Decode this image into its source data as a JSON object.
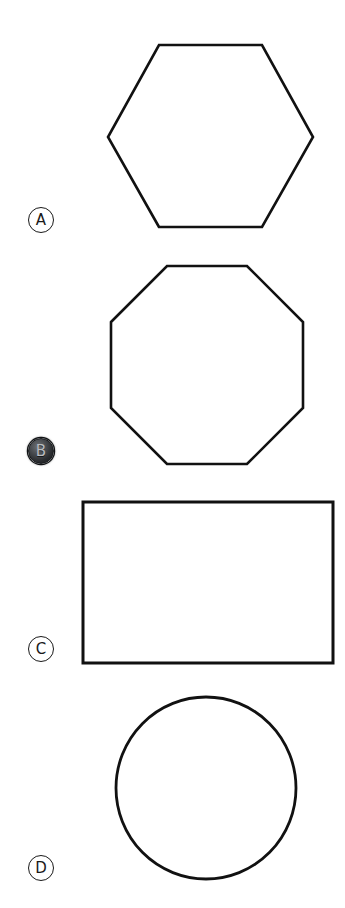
{
  "page": {
    "background_color": "#ffffff",
    "stroke_color": "#111111",
    "width": 345,
    "height": 908
  },
  "questions": [
    {
      "option_letter": "A",
      "shape_name": "hexagon",
      "selected": false,
      "label": {
        "x": 28,
        "y": 207
      },
      "figure": {
        "x": 105,
        "y": 42,
        "width": 211,
        "height": 191,
        "stroke_width": 2.6,
        "points": "54,185 3,95 54,3 157,3 208,95 157,185"
      }
    },
    {
      "option_letter": "B",
      "shape_name": "octagon",
      "selected": true,
      "label": {
        "x": 28,
        "y": 438
      },
      "figure": {
        "x": 108,
        "y": 263,
        "width": 200,
        "height": 204,
        "stroke_width": 2.6,
        "points": "3,59 59,3 139,3 195,59 195,145 139,201 59,201 3,145"
      }
    },
    {
      "option_letter": "C",
      "shape_name": "rectangle",
      "selected": false,
      "label": {
        "x": 28,
        "y": 636
      },
      "figure": {
        "x": 80,
        "y": 499,
        "width": 256,
        "height": 167,
        "stroke_width": 3.0,
        "points": "3,3 253,3 253,164 3,164"
      }
    },
    {
      "option_letter": "D",
      "shape_name": "circle",
      "selected": false,
      "label": {
        "x": 28,
        "y": 855
      },
      "figure": {
        "x": 113,
        "y": 694,
        "width": 186,
        "height": 190,
        "stroke_width": 2.8,
        "cx": 93,
        "cy": 94,
        "rx": 90,
        "ry": 91
      }
    }
  ]
}
